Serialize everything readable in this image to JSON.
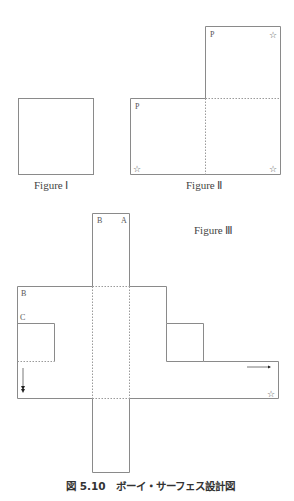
{
  "figures": {
    "figure1": {
      "caption": "Figure Ⅰ"
    },
    "figure2": {
      "caption": "Figure Ⅱ",
      "labels": {
        "p_top": "P",
        "p_left": "P",
        "star": "☆"
      }
    },
    "figure3": {
      "caption": "Figure Ⅲ",
      "labels": {
        "b_top": "B",
        "a_top": "A",
        "b_left": "B",
        "c_left": "C",
        "star": "☆"
      }
    }
  },
  "caption": "図 5.10　ボーイ・サーフェス設計図",
  "colors": {
    "line": "#8a8a8a",
    "dashed": "#9a9a9a",
    "text": "#444444"
  }
}
